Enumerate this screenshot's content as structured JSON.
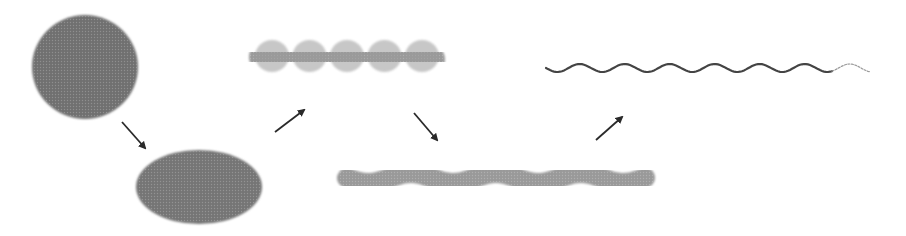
{
  "diagram": {
    "type": "morphological-transformation-sequence",
    "background": "#ffffff",
    "stages": [
      {
        "id": "sphere",
        "shape": "circle",
        "cx": 85,
        "cy": 67,
        "rx": 53,
        "ry": 52,
        "fill": "#6f6f6f"
      },
      {
        "id": "ellipsoid",
        "shape": "ellipse",
        "cx": 199,
        "cy": 187,
        "rx": 63,
        "ry": 37,
        "fill": "#757575"
      },
      {
        "id": "wavy-rod",
        "shape": "wavy-thick-rod",
        "x1": 264,
        "x2": 430,
        "cy": 57,
        "thickness": 30,
        "amplitude": 3,
        "wavelength": 40,
        "fill": "#9a9a9a"
      },
      {
        "id": "elongated-wavy-rod",
        "shape": "wavy-rod",
        "x1": 347,
        "x2": 646,
        "cy": 178,
        "thickness": 20,
        "amplitude": 5,
        "wavelength": 85,
        "fill": "#999999"
      },
      {
        "id": "thin-filament",
        "shape": "wavy-line",
        "x1": 546,
        "x2": 870,
        "cy": 68,
        "thickness": 2.2,
        "amplitude": 4,
        "wavelength": 45,
        "fill": "#444444"
      }
    ],
    "arrows": [
      {
        "id": "sphere-to-ellipsoid",
        "from": "sphere",
        "to": "ellipsoid",
        "x1": 122,
        "y1": 122,
        "x2": 145,
        "y2": 148
      },
      {
        "id": "ellipsoid-to-wavy-rod",
        "from": "ellipsoid",
        "to": "wavy-rod",
        "x1": 275,
        "y1": 132,
        "x2": 304,
        "y2": 110
      },
      {
        "id": "wavy-rod-to-elongated-rod",
        "from": "wavy-rod",
        "to": "elongated-wavy-rod",
        "x1": 414,
        "y1": 113,
        "x2": 437,
        "y2": 140
      },
      {
        "id": "elongated-rod-to-filament",
        "from": "elongated-wavy-rod",
        "to": "thin-filament",
        "x1": 596,
        "y1": 140,
        "x2": 622,
        "y2": 117
      }
    ],
    "arrow_color": "#2a2a2a"
  }
}
